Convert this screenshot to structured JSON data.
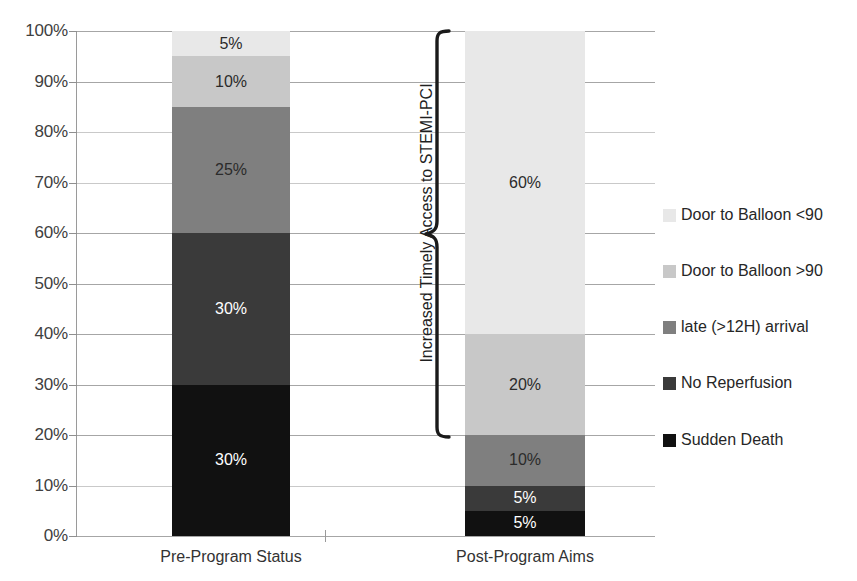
{
  "chart_data": {
    "type": "bar",
    "subtype": "stacked-100-percent",
    "title": "",
    "xlabel": "",
    "ylabel": "",
    "ylim": [
      0,
      100
    ],
    "grid": true,
    "legend_position": "right",
    "categories": [
      "Pre-Program Status",
      "Post-Program Aims"
    ],
    "y_ticks": [
      "0%",
      "10%",
      "20%",
      "30%",
      "40%",
      "50%",
      "60%",
      "70%",
      "80%",
      "90%",
      "100%"
    ],
    "y_tick_values": [
      0,
      10,
      20,
      30,
      40,
      50,
      60,
      70,
      80,
      90,
      100
    ],
    "series": [
      {
        "name": "Sudden Death",
        "color": "#111111",
        "values": [
          30,
          5
        ],
        "labels": [
          "30%",
          "5%"
        ]
      },
      {
        "name": "No Reperfusion",
        "color": "#3a3a3a",
        "values": [
          30,
          5
        ],
        "labels": [
          "30%",
          "5%"
        ]
      },
      {
        "name": "late (>12H) arrival",
        "color": "#7f7f7f",
        "values": [
          25,
          10
        ],
        "labels": [
          "25%",
          "10%"
        ]
      },
      {
        "name": "Door to Balloon >90",
        "color": "#c8c8c8",
        "values": [
          10,
          20
        ],
        "labels": [
          "10%",
          "20%"
        ]
      },
      {
        "name": "Door to Balloon <90",
        "color": "#e8e8e8",
        "values": [
          5,
          60
        ],
        "labels": [
          "5%",
          "60%"
        ]
      }
    ],
    "annotations": [
      {
        "text": "Increased Timely Access to STEMI-PCI",
        "type": "brace",
        "orientation": "vertical",
        "from_value": 20,
        "to_value": 100,
        "tip_value": 60
      }
    ]
  },
  "legend": {
    "entries": [
      {
        "label": "Door to Balloon <90",
        "color": "#e8e8e8"
      },
      {
        "label": "Door to Balloon >90",
        "color": "#c8c8c8"
      },
      {
        "label": "late (>12H) arrival",
        "color": "#7f7f7f"
      },
      {
        "label": "No Reperfusion",
        "color": "#3a3a3a"
      },
      {
        "label": "Sudden Death",
        "color": "#111111"
      }
    ]
  },
  "axis": {
    "y_labels": [
      "100%",
      "90%",
      "80%",
      "70%",
      "60%",
      "50%",
      "40%",
      "30%",
      "20%",
      "10%",
      "0%"
    ]
  },
  "bars": [
    {
      "category": "Pre-Program Status",
      "segments": [
        {
          "label": "5%",
          "value": 5,
          "color": "#e8e8e8",
          "series": "Door to Balloon <90",
          "text_on_dark": false
        },
        {
          "label": "10%",
          "value": 10,
          "color": "#c8c8c8",
          "series": "Door to Balloon >90",
          "text_on_dark": false
        },
        {
          "label": "25%",
          "value": 25,
          "color": "#7f7f7f",
          "series": "late (>12H) arrival",
          "text_on_dark": false
        },
        {
          "label": "30%",
          "value": 30,
          "color": "#3a3a3a",
          "series": "No Reperfusion",
          "text_on_dark": true
        },
        {
          "label": "30%",
          "value": 30,
          "color": "#111111",
          "series": "Sudden Death",
          "text_on_dark": true
        }
      ]
    },
    {
      "category": "Post-Program Aims",
      "segments": [
        {
          "label": "60%",
          "value": 60,
          "color": "#e8e8e8",
          "series": "Door to Balloon <90",
          "text_on_dark": false
        },
        {
          "label": "20%",
          "value": 20,
          "color": "#c8c8c8",
          "series": "Door to Balloon >90",
          "text_on_dark": false
        },
        {
          "label": "10%",
          "value": 10,
          "color": "#7f7f7f",
          "series": "late (>12H) arrival",
          "text_on_dark": false
        },
        {
          "label": "5%",
          "value": 5,
          "color": "#3a3a3a",
          "series": "No Reperfusion",
          "text_on_dark": true
        },
        {
          "label": "5%",
          "value": 5,
          "color": "#111111",
          "series": "Sudden Death",
          "text_on_dark": true
        }
      ]
    }
  ],
  "annotation": {
    "brace_label": "Increased Timely Access to STEMI-PCI"
  }
}
